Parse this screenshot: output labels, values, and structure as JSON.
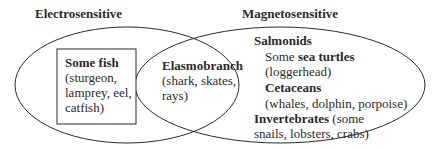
{
  "venn": {
    "left_set": {
      "label": "Electrosensitive",
      "exclusive_region": {
        "boxed": true,
        "title": "Some fish",
        "lines": [
          "(sturgeon,",
          "lamprey, eel,",
          "catfish)"
        ]
      }
    },
    "right_set": {
      "label": "Magnetosensitive",
      "items": [
        {
          "title": "Salmonids"
        },
        {
          "prefix": "Some ",
          "title": "sea turtles",
          "detail": "(loggerhead)"
        },
        {
          "title": "Cetaceans",
          "detail": "(whales, dolphin, porpoise)"
        },
        {
          "title": "Invertebrates",
          "suffix": " (some",
          "detail": "snails, lobsters, crabs)"
        }
      ]
    },
    "intersection": {
      "title": "Elasmobranch",
      "lines": [
        "(shark, skates,",
        "rays)"
      ]
    },
    "colors": {
      "stroke": "#2a2a2a",
      "text": "#2a2a2a",
      "background": "#ffffff"
    }
  }
}
